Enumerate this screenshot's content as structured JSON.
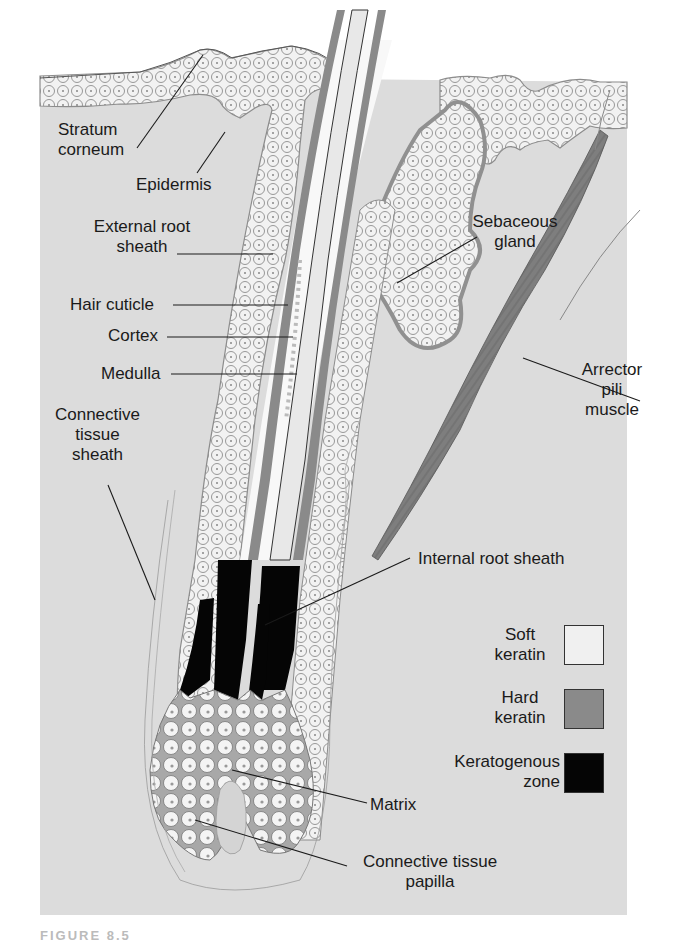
{
  "figure": {
    "caption_partial": "FIGURE 8.5"
  },
  "labels": {
    "stratum_corneum": [
      "Stratum",
      "corneum"
    ],
    "epidermis": "Epidermis",
    "external_root_sheath": [
      "External root",
      "sheath"
    ],
    "hair_cuticle": "Hair cuticle",
    "cortex": "Cortex",
    "medulla": "Medulla",
    "connective_tissue_sheath": [
      "Connective",
      "tissue",
      "sheath"
    ],
    "sebaceous_gland": [
      "Sebaceous",
      "gland"
    ],
    "arrector_pili_muscle": [
      "Arrector",
      "pili",
      "muscle"
    ],
    "internal_root_sheath": "Internal root sheath",
    "matrix": "Matrix",
    "connective_tissue_papilla": [
      "Connective tissue",
      "papilla"
    ]
  },
  "legend": [
    {
      "label": [
        "Soft",
        "keratin"
      ],
      "color": "#f0f0f0"
    },
    {
      "label": [
        "Hard",
        "keratin"
      ],
      "color": "#8a8a8a"
    },
    {
      "label": [
        "Keratogenous",
        "zone"
      ],
      "color": "#050505"
    }
  ],
  "colors": {
    "background_tissue": "#dcdcdc",
    "soft_keratin": "#f0f0f0",
    "hard_keratin": "#8a8a8a",
    "keratogenous_zone": "#050505",
    "cell_outline": "#8c8c8c",
    "leader_line": "#1a1a1a"
  }
}
